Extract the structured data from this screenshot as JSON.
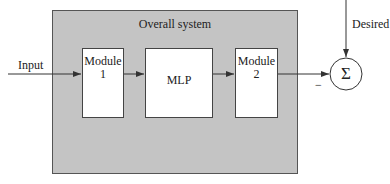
{
  "diagram": {
    "system": {
      "title": "Overall system"
    },
    "input_label": "Input",
    "desired_label": "Desired",
    "blocks": [
      {
        "id": "module-1",
        "line1": "Module",
        "line2": "1"
      },
      {
        "id": "mlp",
        "line1": "MLP"
      },
      {
        "id": "module-2",
        "line1": "Module",
        "line2": "2"
      }
    ],
    "summer": {
      "symbol": "Σ",
      "sign_from_module2": "−"
    },
    "colors": {
      "system_fill": "#c4c4c4",
      "block_fill": "#ffffff",
      "line": "#333333"
    }
  }
}
